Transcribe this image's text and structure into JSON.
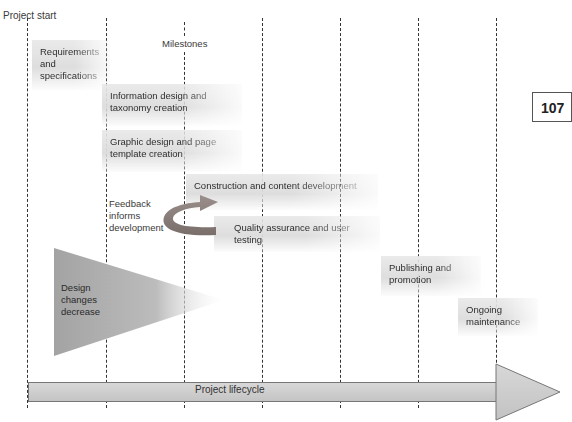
{
  "diagram": {
    "top_label": "Project start",
    "milestones_label": "Milestones",
    "page_number": "107",
    "phases": [
      {
        "label_line1": "Requirements",
        "label_line2": "and",
        "label_line3": "specifications"
      },
      {
        "label_line1": "Information design and",
        "label_line2": "taxonomy creation"
      },
      {
        "label_line1": "Graphic design and page",
        "label_line2": "template creation"
      },
      {
        "label_line1": "Construction and content development"
      },
      {
        "label_line1": "Quality assurance and user testing"
      },
      {
        "label_line1": "Publishing and",
        "label_line2": "promotion"
      },
      {
        "label_line1": "Ongoing",
        "label_line2": "maintenance"
      }
    ],
    "feedback_label": {
      "line1": "Feedback",
      "line2": "informs",
      "line3": "development"
    },
    "design_changes_label": {
      "line1": "Design",
      "line2": "changes",
      "line3": "decrease"
    },
    "lifecycle_label": "Project lifecycle",
    "colors": {
      "dashed_lines": "#333333",
      "feedback_arrow": "#8a7f7c",
      "wedge": "#a8a8a8",
      "lifecycle_bar": "#cfcfcf"
    }
  }
}
